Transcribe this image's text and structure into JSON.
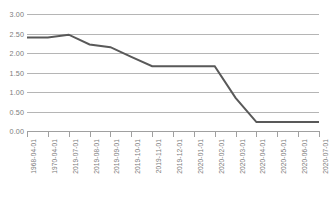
{
  "chart_data": {
    "type": "line",
    "title": "",
    "subtitle": "",
    "xlabel": "",
    "ylabel": "",
    "categories": [
      "1968-04-01",
      "1970-04-01",
      "2019-07-01",
      "2019-08-01",
      "2019-09-01",
      "2019-10-01",
      "2019-11-01",
      "2019-12-01",
      "2020-01-01",
      "2020-02-01",
      "2020-03-01",
      "2020-04-01",
      "2020-05-01",
      "2020-06-01",
      "2020-07-01"
    ],
    "values": [
      2.4,
      2.4,
      2.47,
      2.22,
      2.15,
      1.9,
      1.66,
      1.66,
      1.66,
      1.66,
      0.85,
      0.23,
      0.23,
      0.23,
      0.23
    ],
    "series": [
      {
        "name": "series-1",
        "color": "#595959",
        "values": [
          2.4,
          2.4,
          2.47,
          2.22,
          2.15,
          1.9,
          1.66,
          1.66,
          1.66,
          1.66,
          0.85,
          0.23,
          0.23,
          0.23,
          0.23
        ]
      }
    ],
    "ylim": [
      0,
      3
    ],
    "y_ticks": [
      0,
      0.5,
      1,
      1.5,
      2,
      2.5,
      3
    ],
    "y_tick_labels": [
      "0.00",
      "0.50",
      "1.00",
      "1.50",
      "2.00",
      "2.50",
      "3.00"
    ],
    "grid": true,
    "grid_axis": "y",
    "legend": false,
    "legend_position": "none",
    "line_color": "#595959",
    "line_width": 2,
    "markers": false,
    "x_tick_rotation": -90,
    "annotations": []
  },
  "style": {
    "background": "#ffffff",
    "grid_color": "#b5b5b5",
    "axis_color": "#a0a0a0",
    "tick_label_color": "#7b7b7b"
  }
}
